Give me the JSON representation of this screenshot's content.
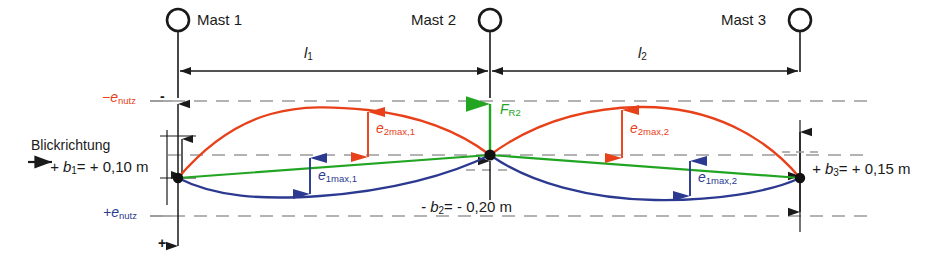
{
  "diagram": {
    "title_text": "Mast deflection / sag diagram",
    "view_label": "Blickrichtung",
    "masts": [
      {
        "name": "Mast 1",
        "x": 178
      },
      {
        "name": "Mast 2",
        "x": 490
      },
      {
        "name": "Mast 3",
        "x": 800
      }
    ],
    "spans": [
      {
        "label": "l",
        "sub": "1",
        "from_x": 178,
        "to_x": 490
      },
      {
        "label": "l",
        "sub": "2",
        "from_x": 490,
        "to_x": 800
      }
    ],
    "reference_lines": [
      {
        "name": "-e_nutz",
        "sign": "−",
        "base": "e",
        "sub": "nutz",
        "y": 101,
        "color": "#e8411a"
      },
      {
        "name": "+e_nutz",
        "sign": "+",
        "base": "e",
        "sub": "nutz",
        "y": 216,
        "color": "#2b3990"
      }
    ],
    "offsets": [
      {
        "id": "b1",
        "text": "+ b",
        "sub": "1",
        "value": "= + 0,10 m",
        "full": "+b₁= + 0,10 m"
      },
      {
        "id": "b2",
        "text": "- b",
        "sub": "2",
        "value": "= - 0,20 m",
        "full": "-b₂= - 0,20 m"
      },
      {
        "id": "b3",
        "text": "+ b",
        "sub": "3",
        "value": "= + 0,15 m",
        "full": "+b₃= + 0,15 m"
      }
    ],
    "deflections": [
      {
        "id": "e2max1",
        "base": "e",
        "sub": "2max,1",
        "color": "#e8411a",
        "x": 368,
        "y_top": 110,
        "y_bot": 157
      },
      {
        "id": "e1max1",
        "base": "e",
        "sub": "1max,1",
        "color": "#2b3990",
        "x": 310,
        "y_top": 158,
        "y_bot": 193
      },
      {
        "id": "e2max2",
        "base": "e",
        "sub": "2max,2",
        "color": "#e8411a",
        "x": 622,
        "y_top": 110,
        "y_bot": 158
      },
      {
        "id": "e1max2",
        "base": "e",
        "sub": "1max,2",
        "color": "#2b3990",
        "x": 690,
        "y_top": 160,
        "y_bot": 195
      }
    ],
    "force": {
      "base": "F",
      "sub": "R2",
      "color": "#22a522",
      "x": 490
    },
    "axis_signs": {
      "top": "-",
      "bottom": "+"
    },
    "colors": {
      "curve_upper": "#e8411a",
      "chord": "#22a522",
      "curve_lower": "#2b3990",
      "structure": "#1a1a1a",
      "dashed": "#9a9a9a"
    }
  }
}
